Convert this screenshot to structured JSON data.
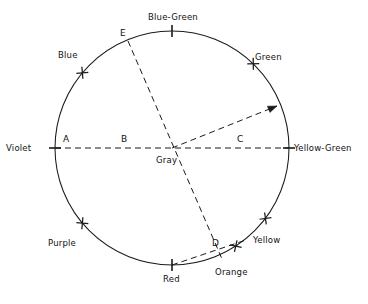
{
  "figure": {
    "type": "color-wheel-diagram",
    "geometry": {
      "center": {
        "x": 172,
        "y": 148
      },
      "radius": 117,
      "stroke_color": "#1a1a1a",
      "background_color": "#ffffff"
    }
  },
  "center_point": {
    "label": "Gray",
    "x": 172,
    "y": 148
  },
  "hues": [
    {
      "name": "Violet",
      "angle_deg": 180,
      "tick": "bar",
      "label_x": 6,
      "label_y": 144
    },
    {
      "name": "Blue",
      "angle_deg": 140,
      "tick": "cross",
      "label_x": 58,
      "label_y": 51
    },
    {
      "name": "Blue-Green",
      "angle_deg": 90,
      "tick": "bar",
      "label_x": 148,
      "label_y": 13
    },
    {
      "name": "Green",
      "angle_deg": 46,
      "tick": "cross",
      "label_x": 255,
      "label_y": 53
    },
    {
      "name": "Yellow-Green",
      "angle_deg": 0,
      "tick": "bar",
      "label_x": 294,
      "label_y": 144
    },
    {
      "name": "Yellow",
      "angle_deg": -37,
      "tick": "cross",
      "label_x": 253,
      "label_y": 236
    },
    {
      "name": "Orange",
      "angle_deg": -57,
      "tick": "cross",
      "label_x": 215,
      "label_y": 268
    },
    {
      "name": "Red",
      "angle_deg": -90,
      "tick": "bar",
      "label_x": 163,
      "label_y": 275
    },
    {
      "name": "Purple",
      "angle_deg": -140,
      "tick": "cross",
      "label_x": 48,
      "label_y": 239
    }
  ],
  "segment_labels": [
    {
      "name": "A",
      "x": 63,
      "y": 135
    },
    {
      "name": "B",
      "x": 121,
      "y": 135
    },
    {
      "name": "C",
      "x": 237,
      "y": 135
    },
    {
      "name": "D",
      "x": 212,
      "y": 239
    },
    {
      "name": "E",
      "x": 120,
      "y": 29
    }
  ],
  "dashed_lines": [
    {
      "name": "violet-yellowgreen-axis",
      "from": {
        "x": 55,
        "y": 148
      },
      "to": {
        "x": 289,
        "y": 148
      },
      "arrow": false
    },
    {
      "name": "E-D-diagonal",
      "from": {
        "x": 128,
        "y": 41
      },
      "to": {
        "x": 222,
        "y": 259
      },
      "arrow": false
    },
    {
      "name": "gray-to-circumference-vector",
      "from": {
        "x": 172,
        "y": 148
      },
      "to": {
        "x": 277,
        "y": 106
      },
      "arrow": true
    },
    {
      "name": "red-to-yellow-chord",
      "from": {
        "x": 172,
        "y": 265
      },
      "to": {
        "x": 246,
        "y": 240
      },
      "arrow": false
    }
  ]
}
